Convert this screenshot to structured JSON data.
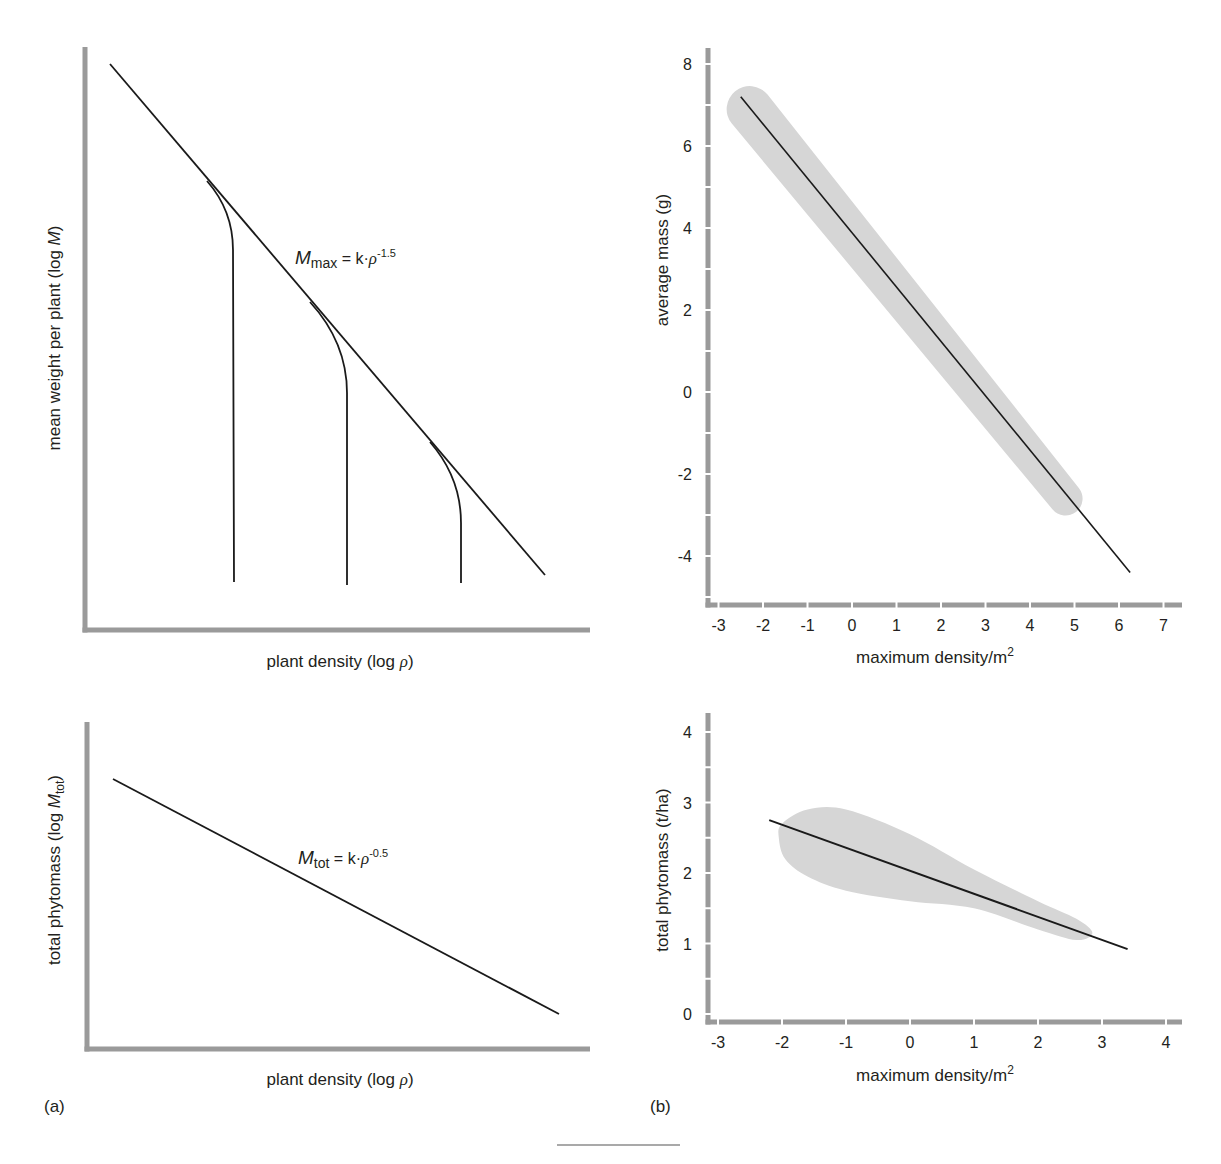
{
  "figure": {
    "panel_labels": [
      "(a)",
      "(b)"
    ],
    "colors": {
      "axis": "#9a9a9a",
      "line": "#1a1a1a",
      "band": "#d6d6d6",
      "text": "#231f20"
    }
  },
  "chart_data": [
    {
      "id": "a-top",
      "type": "line",
      "title": "",
      "xlabel": "plant density (log ρ)",
      "ylabel": "mean weight per plant (log M)",
      "ticks": false,
      "annotation": {
        "main": "M",
        "sub": "max",
        "rest": " = k·ρ",
        "sup": "-1.5"
      },
      "series": [
        {
          "name": "self-thinning line M_max = k·ρ^-1.5",
          "points_px": [
            [
              110,
              64
            ],
            [
              545,
              575
            ]
          ]
        },
        {
          "name": "stand 1 trajectory",
          "points_px": [
            [
              207,
              181
            ],
            [
              233,
              250
            ],
            [
              234,
              582
            ]
          ]
        },
        {
          "name": "stand 2 trajectory",
          "points_px": [
            [
              310,
              302
            ],
            [
              347,
              393
            ],
            [
              347,
              585
            ]
          ]
        },
        {
          "name": "stand 3 trajectory",
          "points_px": [
            [
              430,
              442
            ],
            [
              461,
              523
            ],
            [
              461,
              583
            ]
          ]
        }
      ]
    },
    {
      "id": "a-bottom",
      "type": "line",
      "title": "",
      "xlabel": "plant density (log ρ)",
      "ylabel": "total phytomass (log M_tot)",
      "ticks": false,
      "annotation": {
        "main": "M",
        "sub": "tot",
        "rest": " = k·ρ",
        "sup": "-0.5"
      },
      "series": [
        {
          "name": "M_tot = k·ρ^-0.5",
          "points_px": [
            [
              113,
              779
            ],
            [
              559,
              1014
            ]
          ]
        }
      ]
    },
    {
      "id": "b-top",
      "type": "line",
      "title": "",
      "xlabel": "maximum density/m²",
      "ylabel": "average mass (g)",
      "xlim": [
        -3.2,
        7.4
      ],
      "ylim": [
        -5.2,
        8.4
      ],
      "xticks": [
        -3,
        -2,
        -1,
        0,
        1,
        2,
        3,
        4,
        5,
        6,
        7
      ],
      "yticks": [
        -4,
        -2,
        0,
        2,
        4,
        6,
        8
      ],
      "series": [
        {
          "name": "regression line",
          "x": [
            -2.5,
            6.25
          ],
          "y": [
            7.2,
            -4.4
          ]
        }
      ],
      "band": {
        "name": "data envelope",
        "x": [
          -2.3,
          4.8
        ],
        "y": [
          6.9,
          -2.6
        ],
        "width_start": 46,
        "width_end": 34
      }
    },
    {
      "id": "b-bottom",
      "type": "line",
      "title": "",
      "xlabel": "maximum density/m²",
      "ylabel": "total phytomass (t/ha)",
      "xlim": [
        -3.1,
        4.3
      ],
      "ylim": [
        -0.1,
        4.25
      ],
      "xticks": [
        -3,
        -2,
        -1,
        0,
        1,
        2,
        3,
        4
      ],
      "yticks": [
        0,
        1,
        2,
        3,
        4
      ],
      "series": [
        {
          "name": "regression line",
          "x": [
            -2.2,
            3.4
          ],
          "y": [
            2.75,
            0.92
          ]
        }
      ],
      "band_outline": [
        [
          -2.0,
          2.7
        ],
        [
          -1.6,
          2.9
        ],
        [
          -1.0,
          2.9
        ],
        [
          0.0,
          2.55
        ],
        [
          1.0,
          2.05
        ],
        [
          2.0,
          1.6
        ],
        [
          2.6,
          1.35
        ],
        [
          2.85,
          1.15
        ],
        [
          2.6,
          1.05
        ],
        [
          2.0,
          1.2
        ],
        [
          1.0,
          1.5
        ],
        [
          0.0,
          1.6
        ],
        [
          -1.0,
          1.75
        ],
        [
          -1.6,
          1.95
        ],
        [
          -1.95,
          2.2
        ],
        [
          -2.05,
          2.5
        ]
      ]
    }
  ],
  "layout": {
    "a_top": {
      "x0": 85,
      "y0": 630,
      "top": 47,
      "right": 590
    },
    "a_bottom": {
      "x0": 87,
      "y0": 1049,
      "top": 722,
      "right": 590
    },
    "b_top": {
      "x0": 708,
      "y0": 605,
      "top": 48,
      "right": 1182,
      "ox": 852,
      "sx": 44.5,
      "oy": 392,
      "sy": 41
    },
    "b_bottom": {
      "x0": 708,
      "y0": 1022,
      "top": 713,
      "right": 1182,
      "ox": 910,
      "sx": 64,
      "oy": 1014,
      "sy": 70.5
    }
  }
}
